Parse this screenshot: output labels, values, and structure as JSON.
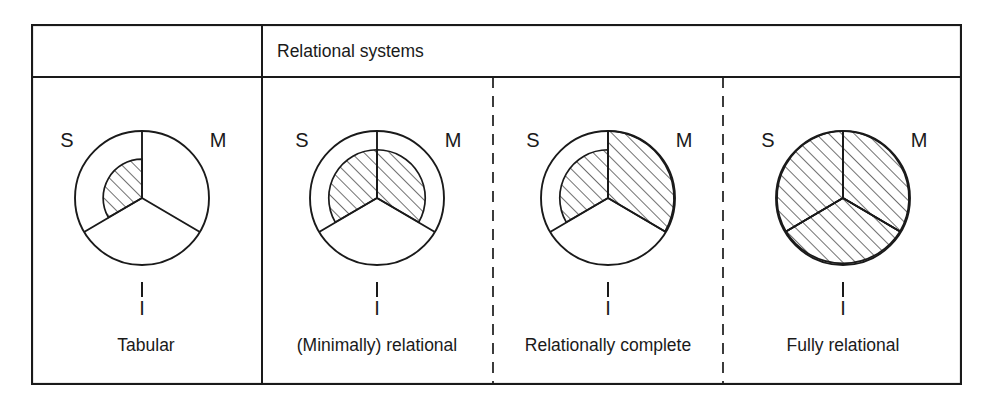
{
  "figure": {
    "header": {
      "empty_cell_label": "",
      "spanning_label": "Relational systems"
    },
    "sector_labels": {
      "s": "S",
      "m": "M",
      "i": "I"
    },
    "columns": [
      {
        "id": "tabular",
        "label": "Tabular",
        "divider_before": "none",
        "sectors": {
          "S": {
            "fill": "hatched",
            "extent": 0.58
          },
          "M": {
            "fill": "empty",
            "extent": 0
          },
          "I": {
            "fill": "empty",
            "extent": 0
          }
        }
      },
      {
        "id": "minimally-relational",
        "label": "(Minimally) relational",
        "divider_before": "solid",
        "sectors": {
          "S": {
            "fill": "hatched",
            "extent": 0.72
          },
          "M": {
            "fill": "hatched",
            "extent": 0.72
          },
          "I": {
            "fill": "empty",
            "extent": 0
          }
        }
      },
      {
        "id": "relationally-complete",
        "label": "Relationally complete",
        "divider_before": "dashed",
        "sectors": {
          "S": {
            "fill": "hatched",
            "extent": 0.72
          },
          "M": {
            "fill": "hatched",
            "extent": 1.0
          },
          "I": {
            "fill": "empty",
            "extent": 0
          }
        }
      },
      {
        "id": "fully-relational",
        "label": "Fully relational",
        "divider_before": "dashed",
        "sectors": {
          "S": {
            "fill": "hatched",
            "extent": 1.0
          },
          "M": {
            "fill": "hatched",
            "extent": 1.0
          },
          "I": {
            "fill": "hatched",
            "extent": 1.0
          }
        }
      }
    ],
    "colors": {
      "ink": "#1a1a1a",
      "paper": "#ffffff"
    }
  }
}
